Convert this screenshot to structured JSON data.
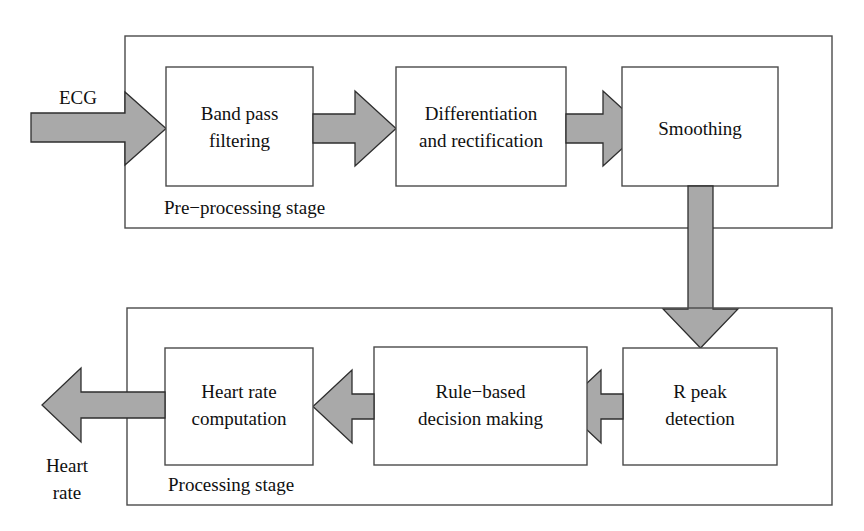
{
  "diagram": {
    "colors": {
      "arrow_fill": "#a9a9a9",
      "arrow_stroke": "#2e2e2e",
      "box_stroke": "#4a4a4a",
      "box_fill": "#ffffff",
      "background": "#ffffff",
      "text": "#101010"
    },
    "inputs": [
      {
        "id": "ecg",
        "label": "ECG"
      }
    ],
    "outputs": [
      {
        "id": "heart-rate",
        "label_line1": "Heart",
        "label_line2": "rate"
      }
    ],
    "stages": [
      {
        "id": "pre-processing",
        "label": "Pre−processing stage",
        "blocks": [
          {
            "id": "band-pass-filtering",
            "line1": "Band pass",
            "line2": "filtering"
          },
          {
            "id": "differentiation-rectification",
            "line1": "Differentiation",
            "line2": "and rectification"
          },
          {
            "id": "smoothing",
            "line1": "Smoothing",
            "line2": ""
          }
        ]
      },
      {
        "id": "processing",
        "label": "Processing stage",
        "blocks": [
          {
            "id": "r-peak-detection",
            "line1": "R peak",
            "line2": "detection"
          },
          {
            "id": "rule-based-decision-making",
            "line1": "Rule−based",
            "line2": "decision making"
          },
          {
            "id": "heart-rate-computation",
            "line1": "Heart rate",
            "line2": "computation"
          }
        ]
      }
    ],
    "connections": [
      {
        "id": "ecg-to-band-pass",
        "from": "ecg",
        "to": "band-pass-filtering",
        "direction": "right"
      },
      {
        "id": "band-pass-to-differentiation",
        "from": "band-pass-filtering",
        "to": "differentiation-rectification",
        "direction": "right"
      },
      {
        "id": "differentiation-to-smoothing",
        "from": "differentiation-rectification",
        "to": "smoothing",
        "direction": "right"
      },
      {
        "id": "smoothing-to-r-peak",
        "from": "smoothing",
        "to": "r-peak-detection",
        "direction": "down"
      },
      {
        "id": "r-peak-to-rule-based",
        "from": "r-peak-detection",
        "to": "rule-based-decision-making",
        "direction": "left"
      },
      {
        "id": "rule-based-to-heart-rate-computation",
        "from": "rule-based-decision-making",
        "to": "heart-rate-computation",
        "direction": "left"
      },
      {
        "id": "heart-rate-computation-to-output",
        "from": "heart-rate-computation",
        "to": "heart-rate",
        "direction": "left"
      }
    ]
  }
}
